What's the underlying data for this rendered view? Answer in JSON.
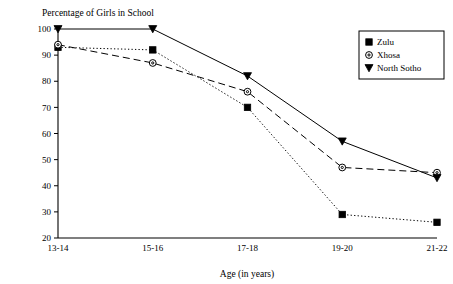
{
  "chart_data": {
    "type": "line",
    "title": "Percentage of Girls in School",
    "xlabel": "Age (in years)",
    "ylabel": "",
    "categories": [
      "13-14",
      "15-16",
      "17-18",
      "19-20",
      "21-22"
    ],
    "ylim": [
      20,
      100
    ],
    "yticks": [
      20,
      30,
      40,
      50,
      60,
      70,
      80,
      90,
      100
    ],
    "ytick_labels": [
      "20",
      "30",
      "40",
      "50",
      "60",
      "70",
      "80",
      "90",
      "100"
    ],
    "grid": false,
    "legend_position": "top-right",
    "series": [
      {
        "name": "Zulu",
        "marker": "filled-square",
        "linestyle": "dotted",
        "values": [
          93,
          92,
          70,
          29,
          26
        ]
      },
      {
        "name": "Xhosa",
        "marker": "open-circle",
        "linestyle": "dashed",
        "values": [
          94,
          87,
          76,
          47,
          45
        ]
      },
      {
        "name": "North Sotho",
        "marker": "filled-triangle-down",
        "linestyle": "solid",
        "values": [
          100,
          100,
          82,
          57,
          43
        ]
      }
    ]
  }
}
